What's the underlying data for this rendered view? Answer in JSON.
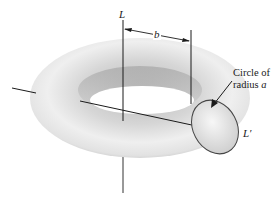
{
  "diagram": {
    "labels": {
      "axis_L": "L",
      "major_radius": "b",
      "axis_L_prime": "L′",
      "callout_line1": "Circle of",
      "callout_line2_text": "radius ",
      "callout_line2_var": "a"
    },
    "colors": {
      "torus_light": "#f4f4f4",
      "torus_mid": "#c8c8c8",
      "torus_dark": "#9a9a9a",
      "lines": "#1a1a1a"
    }
  }
}
